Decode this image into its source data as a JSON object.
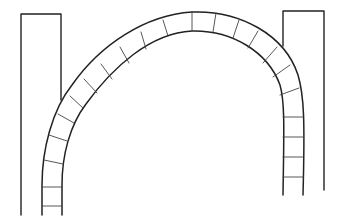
{
  "diagram": {
    "type": "line-drawing",
    "colors": {
      "background": "#ffffff",
      "line": "#222222",
      "joint": "#444444"
    },
    "pillars": [
      {
        "name": "left-pillar",
        "x": 21,
        "y": 14,
        "width": 40,
        "left_bottom": 215,
        "right_bottom": 100
      },
      {
        "name": "right-pillar",
        "x": 283,
        "y": 11,
        "width": 41,
        "left_bottom": 46,
        "right_bottom": 190
      }
    ],
    "arch": {
      "outer_path": "M 42 215 L 42 185 C 42 150, 52 110, 72 85 C 100 45, 145 15, 192 12 C 240 10, 285 35, 298 75 C 304 95, 305 120, 303 195",
      "inner_path": "M 62 215 L 62 185 C 62 155, 70 125, 86 104 C 112 68, 150 33, 192 31 C 232 30, 268 52, 280 85 C 285 102, 284 130, 283 195",
      "voussoir_count": 19,
      "joints": [
        [
          42,
          206,
          62,
          206
        ],
        [
          42,
          187,
          62,
          187
        ],
        [
          44,
          160,
          63,
          164
        ],
        [
          49,
          135,
          67,
          141
        ],
        [
          58,
          114,
          74,
          123
        ],
        [
          70,
          96,
          83,
          108
        ],
        [
          84,
          79,
          97,
          93
        ],
        [
          101,
          64,
          112,
          79
        ],
        [
          120,
          47,
          129,
          63
        ],
        [
          141,
          32,
          146,
          49
        ],
        [
          163,
          20,
          168,
          36
        ],
        [
          192,
          12,
          192,
          31
        ],
        [
          216,
          13,
          213,
          32
        ],
        [
          239,
          20,
          233,
          38
        ],
        [
          258,
          31,
          248,
          48
        ],
        [
          277,
          47,
          263,
          63
        ],
        [
          290,
          65,
          273,
          77
        ],
        [
          299,
          88,
          280,
          95
        ],
        [
          303,
          117,
          283,
          117
        ],
        [
          303,
          137,
          283,
          137
        ],
        [
          303,
          157,
          283,
          157
        ],
        [
          303,
          177,
          283,
          177
        ]
      ]
    }
  }
}
